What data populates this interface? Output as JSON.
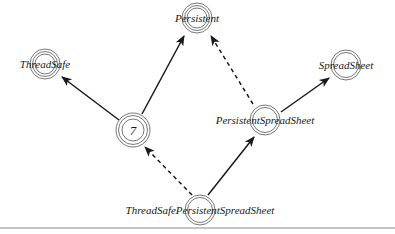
{
  "diagram": {
    "type": "inheritance-graph",
    "nodes": [
      {
        "id": "threadsafe",
        "label": "ThreadSafe",
        "x": 45,
        "y": 64
      },
      {
        "id": "persistent",
        "label": "Persistent",
        "x": 197,
        "y": 18
      },
      {
        "id": "spreadsheet",
        "label": "SpreadSheet",
        "x": 346,
        "y": 65
      },
      {
        "id": "seven",
        "label": "7",
        "x": 133,
        "y": 130
      },
      {
        "id": "persistentspreadsheet",
        "label": "PersistentSpreadSheet",
        "x": 265,
        "y": 120
      },
      {
        "id": "threadsafepersistentspreadsheet",
        "label": "ThreadSafePersistentSpreadSheet",
        "x": 200,
        "y": 210
      }
    ],
    "edges": [
      {
        "from": "seven",
        "to": "threadsafe",
        "style": "solid"
      },
      {
        "from": "seven",
        "to": "persistent",
        "style": "solid"
      },
      {
        "from": "persistentspreadsheet",
        "to": "persistent",
        "style": "dashed"
      },
      {
        "from": "persistentspreadsheet",
        "to": "spreadsheet",
        "style": "solid"
      },
      {
        "from": "threadsafepersistentspreadsheet",
        "to": "seven",
        "style": "dashed"
      },
      {
        "from": "threadsafepersistentspreadsheet",
        "to": "persistentspreadsheet",
        "style": "solid"
      }
    ],
    "colors": {
      "ink": "#1a1a1a",
      "ring": "#555555",
      "rule": "#888888",
      "background": "#ffffff"
    }
  }
}
